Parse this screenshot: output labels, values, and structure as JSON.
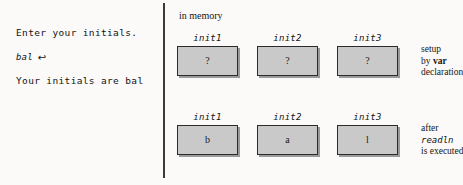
{
  "figure": {
    "background_color": "#fbfaf8",
    "divider_color": "#3a3a3a",
    "box_fill_color": "#c9c9c9",
    "box_border_color": "#2b2b2b"
  },
  "console": {
    "lines": [
      {
        "text": "Enter your initials.",
        "style": "plain"
      },
      {
        "text": "bal",
        "style": "italic",
        "return_glyph": "↩"
      },
      {
        "text": "Your initials are bal",
        "style": "plain"
      }
    ]
  },
  "memory": {
    "caption": "in memory",
    "rows": [
      {
        "cells": [
          {
            "label": "init1",
            "value": "?"
          },
          {
            "label": "init2",
            "value": "?"
          },
          {
            "label": "init3",
            "value": "?"
          }
        ],
        "note": {
          "line1": "setup",
          "line2_prefix": "by ",
          "line2_keyword": "var",
          "line3": "declaration"
        }
      },
      {
        "cells": [
          {
            "label": "init1",
            "value": "b"
          },
          {
            "label": "init2",
            "value": "a"
          },
          {
            "label": "init3",
            "value": "l"
          }
        ],
        "note": {
          "line1": "after",
          "line2_code": "readln",
          "line3": "is executed"
        }
      }
    ]
  }
}
